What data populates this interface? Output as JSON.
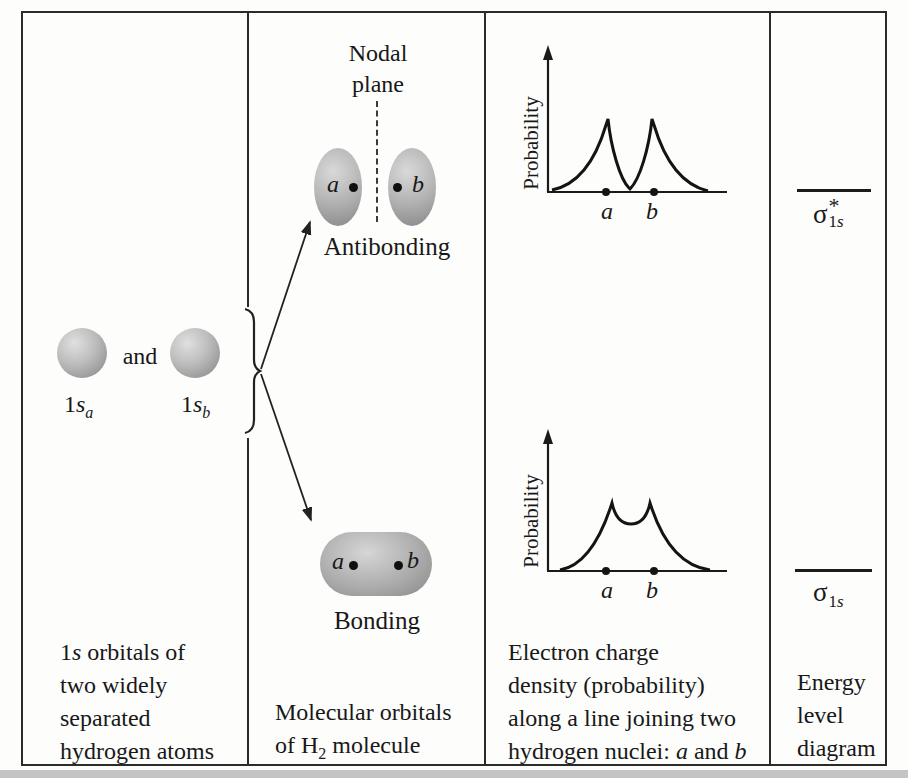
{
  "colors": {
    "ink": "#181818",
    "border": "#2b2b2b",
    "orbital_gray_light": "#dedede",
    "orbital_gray_dark": "#8a8a8a",
    "page_edge_gray": "#c4c4c4"
  },
  "figure": {
    "col1": {
      "and_label": "and",
      "orbital_a": {
        "prefix": "1",
        "s": "s",
        "sub": "a"
      },
      "orbital_b": {
        "prefix": "1",
        "s": "s",
        "sub": "b"
      },
      "caption": {
        "l1_pre": "1",
        "l1_s": "s",
        "l1_post": " orbitals of",
        "l2": "two widely",
        "l3": "separated",
        "l4": "hydrogen atoms"
      }
    },
    "col2": {
      "nodal_line1": "Nodal",
      "nodal_line2": "plane",
      "anti_a": "a",
      "anti_b": "b",
      "antibonding_label": "Antibonding",
      "bond_a": "a",
      "bond_b": "b",
      "bonding_label": "Bonding",
      "caption": {
        "l1": "Molecular orbitals",
        "l2_pre": "of H",
        "l2_sub": "2",
        "l2_post": " molecule"
      }
    },
    "col3": {
      "anti_plot": {
        "ylabel": "Probability",
        "a": "a",
        "b": "b"
      },
      "bond_plot": {
        "ylabel": "Probability",
        "a": "a",
        "b": "b"
      },
      "caption": {
        "l1": "Electron charge",
        "l2": "density (probability)",
        "l3": "along a line joining two",
        "l4_pre": "hydrogen nuclei: ",
        "l4_a": "a",
        "l4_mid": " and ",
        "l4_b": "b"
      }
    },
    "col4": {
      "sigma_star": {
        "sigma": "σ",
        "star": "*",
        "sub_num": "1",
        "sub_s": "s"
      },
      "sigma": {
        "sigma": "σ",
        "sub_num": "1",
        "sub_s": "s"
      },
      "caption": {
        "l1": "Energy",
        "l2": "level",
        "l3": "diagram"
      }
    }
  }
}
